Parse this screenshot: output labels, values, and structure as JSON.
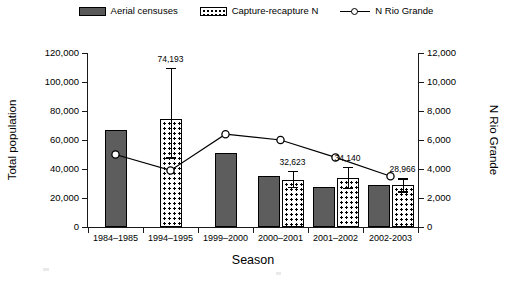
{
  "legend": {
    "items": [
      {
        "label": "Aerial censuses",
        "style": "solid-gray",
        "icon": "legend-swatch-solid"
      },
      {
        "label": "Capture-recapture N",
        "style": "dotted",
        "icon": "legend-swatch-dotted"
      },
      {
        "label": "N Rio Grande",
        "style": "line-marker",
        "icon": "legend-line-marker"
      }
    ]
  },
  "chart_data": {
    "type": "bar",
    "title": "",
    "xlabel": "Season",
    "ylabel": "Total population",
    "y2label": "N Rio Grande",
    "ylim": [
      0,
      120000
    ],
    "y2lim": [
      0,
      12000
    ],
    "ytick_labels": [
      "120,000",
      "100,000",
      "80,000",
      "60,000",
      "40,000",
      "20,000",
      "0"
    ],
    "ytick_values": [
      120000,
      100000,
      80000,
      60000,
      40000,
      20000,
      0
    ],
    "y2tick_labels": [
      "12,000",
      "10,000",
      "8,000",
      "6,000",
      "4,000",
      "2,000",
      "0"
    ],
    "y2tick_values": [
      12000,
      10000,
      8000,
      6000,
      4000,
      2000,
      0
    ],
    "grid": false,
    "legend_position": "top",
    "categories": [
      "1984–1985",
      "1994–1995",
      "1999–2000",
      "2000–2001",
      "2001–2002",
      "2002-2003"
    ],
    "series": [
      {
        "name": "Aerial censuses",
        "axis": "left",
        "values": [
          67000,
          null,
          51000,
          35200,
          27500,
          29000
        ]
      },
      {
        "name": "Capture-recapture N",
        "axis": "left",
        "values": [
          null,
          74193,
          null,
          32623,
          34140,
          28966
        ],
        "error_high": [
          null,
          110000,
          null,
          38500,
          41500,
          33500
        ],
        "error_low": [
          null,
          48000,
          null,
          27500,
          27000,
          24500
        ],
        "data_labels": [
          null,
          "74,193",
          null,
          "32,623",
          "34,140",
          "28,966"
        ]
      },
      {
        "name": "N Rio Grande",
        "axis": "right",
        "values": [
          5000,
          3900,
          6400,
          6000,
          4800,
          3500
        ]
      }
    ]
  }
}
